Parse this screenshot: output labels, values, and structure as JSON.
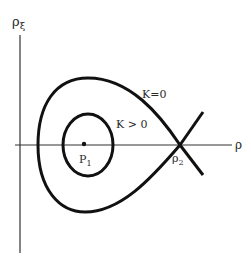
{
  "diagram": {
    "axes": {
      "vertical_label": "ρ",
      "vertical_label_sub": "ξ",
      "horizontal_label": "ρ"
    },
    "curves": {
      "outer_label": "K=0",
      "inner_label": "K > 0"
    },
    "points": {
      "center_label": "P",
      "center_label_sub": "1",
      "saddle_label": "ρ",
      "saddle_label_sub": "2"
    },
    "colors": {
      "ink": "#111111",
      "background": "#ffffff"
    }
  }
}
